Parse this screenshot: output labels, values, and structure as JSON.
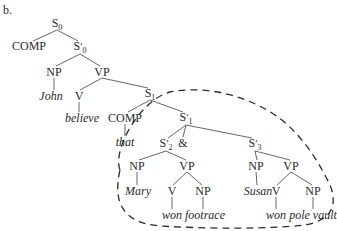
{
  "figure_label": "b.",
  "diagram": {
    "type": "syntax-tree",
    "nodes": [
      {
        "id": "S0",
        "label": "S",
        "prime": false,
        "sub": "0",
        "italic": false,
        "x": 57,
        "y": 24
      },
      {
        "id": "COMP0",
        "label": "COMP",
        "prime": false,
        "sub": "",
        "italic": false,
        "x": 29,
        "y": 46
      },
      {
        "id": "Sp0",
        "label": "S",
        "prime": true,
        "sub": "0",
        "italic": false,
        "x": 80,
        "y": 47
      },
      {
        "id": "NP0",
        "label": "NP",
        "prime": false,
        "sub": "",
        "italic": false,
        "x": 54,
        "y": 72
      },
      {
        "id": "VP0",
        "label": "VP",
        "prime": false,
        "sub": "",
        "italic": false,
        "x": 102,
        "y": 72
      },
      {
        "id": "John",
        "label": "John",
        "prime": false,
        "sub": "",
        "italic": true,
        "x": 51,
        "y": 96
      },
      {
        "id": "V0",
        "label": "V",
        "prime": false,
        "sub": "",
        "italic": false,
        "x": 79,
        "y": 96
      },
      {
        "id": "S1",
        "label": "S",
        "prime": false,
        "sub": "1",
        "italic": false,
        "x": 150,
        "y": 94
      },
      {
        "id": "believe",
        "label": "believe",
        "prime": false,
        "sub": "",
        "italic": true,
        "x": 82,
        "y": 118
      },
      {
        "id": "COMP1",
        "label": "COMP",
        "prime": false,
        "sub": "",
        "italic": false,
        "x": 125,
        "y": 118
      },
      {
        "id": "Sp1",
        "label": "S",
        "prime": true,
        "sub": "1",
        "italic": false,
        "x": 186,
        "y": 118
      },
      {
        "id": "that",
        "label": "that",
        "prime": false,
        "sub": "",
        "italic": true,
        "x": 125,
        "y": 142
      },
      {
        "id": "Sp2",
        "label": "S",
        "prime": true,
        "sub": "2",
        "italic": false,
        "x": 166,
        "y": 144
      },
      {
        "id": "amp",
        "label": "&",
        "prime": false,
        "sub": "",
        "italic": false,
        "x": 183,
        "y": 143
      },
      {
        "id": "Sp3",
        "label": "S",
        "prime": true,
        "sub": "3",
        "italic": false,
        "x": 255,
        "y": 144
      },
      {
        "id": "NP2",
        "label": "NP",
        "prime": false,
        "sub": "",
        "italic": false,
        "x": 137,
        "y": 166
      },
      {
        "id": "VP2",
        "label": "VP",
        "prime": false,
        "sub": "",
        "italic": false,
        "x": 187,
        "y": 166
      },
      {
        "id": "NP3",
        "label": "NP",
        "prime": false,
        "sub": "",
        "italic": false,
        "x": 256,
        "y": 166
      },
      {
        "id": "VP3",
        "label": "VP",
        "prime": false,
        "sub": "",
        "italic": false,
        "x": 291,
        "y": 166
      },
      {
        "id": "Mary",
        "label": "Mary",
        "prime": false,
        "sub": "",
        "italic": true,
        "x": 138,
        "y": 191
      },
      {
        "id": "V2",
        "label": "V",
        "prime": false,
        "sub": "",
        "italic": false,
        "x": 172,
        "y": 191
      },
      {
        "id": "NP2b",
        "label": "NP",
        "prime": false,
        "sub": "",
        "italic": false,
        "x": 203,
        "y": 191
      },
      {
        "id": "Susan",
        "label": "Susan",
        "prime": false,
        "sub": "",
        "italic": true,
        "x": 258,
        "y": 191
      },
      {
        "id": "V3",
        "label": "V",
        "prime": false,
        "sub": "",
        "italic": false,
        "x": 276,
        "y": 191
      },
      {
        "id": "NP3b",
        "label": "NP",
        "prime": false,
        "sub": "",
        "italic": false,
        "x": 313,
        "y": 191
      },
      {
        "id": "won2",
        "label": "won",
        "prime": false,
        "sub": "",
        "italic": true,
        "x": 172,
        "y": 215
      },
      {
        "id": "footrace",
        "label": "footrace",
        "prime": false,
        "sub": "",
        "italic": true,
        "x": 205,
        "y": 215
      },
      {
        "id": "won3",
        "label": "won",
        "prime": false,
        "sub": "",
        "italic": true,
        "x": 276,
        "y": 215
      },
      {
        "id": "polevault",
        "label": "pole vault",
        "prime": false,
        "sub": "",
        "italic": true,
        "x": 313,
        "y": 215
      }
    ],
    "edges": [
      [
        57,
        30,
        33,
        41
      ],
      [
        57,
        30,
        78,
        41
      ],
      [
        80,
        54,
        56,
        66
      ],
      [
        80,
        54,
        100,
        66
      ],
      [
        54,
        78,
        54,
        90
      ],
      [
        102,
        78,
        80,
        90
      ],
      [
        102,
        78,
        148,
        88
      ],
      [
        79,
        102,
        79,
        112
      ],
      [
        150,
        100,
        128,
        112
      ],
      [
        150,
        100,
        183,
        112
      ],
      [
        125,
        124,
        125,
        136
      ],
      [
        186,
        125,
        168,
        138
      ],
      [
        186,
        125,
        183,
        137
      ],
      [
        186,
        125,
        252,
        138
      ],
      [
        166,
        151,
        139,
        160
      ],
      [
        166,
        151,
        186,
        160
      ],
      [
        255,
        151,
        257,
        160
      ],
      [
        255,
        151,
        290,
        160
      ],
      [
        137,
        172,
        137,
        185
      ],
      [
        187,
        172,
        173,
        185
      ],
      [
        187,
        172,
        202,
        185
      ],
      [
        256,
        172,
        257,
        185
      ],
      [
        291,
        172,
        277,
        185
      ],
      [
        291,
        172,
        312,
        185
      ],
      [
        172,
        197,
        172,
        209
      ],
      [
        203,
        197,
        203,
        209
      ],
      [
        276,
        197,
        276,
        209
      ],
      [
        313,
        197,
        313,
        209
      ]
    ],
    "highlight": {
      "style": "dashed",
      "color": "#2a2a2a",
      "encloses": "S1' subtree"
    }
  }
}
